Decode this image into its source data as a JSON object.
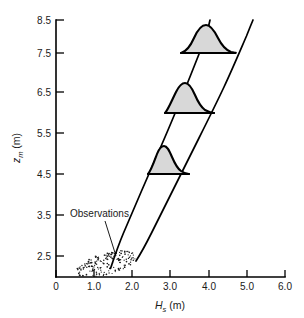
{
  "chart_data": {
    "type": "line",
    "title": "",
    "subtitle": "",
    "xlabel": "Hs (m)",
    "xlabel_symbol": "H",
    "xlabel_sub": "s",
    "xlabel_unit": "(m)",
    "ylabel": "zm (m)",
    "ylabel_symbol": "z",
    "ylabel_sub": "m",
    "ylabel_unit": "(m)",
    "xlim": [
      0,
      6.0
    ],
    "ylim": [
      2.0,
      8.5
    ],
    "grid": false,
    "legend": "none",
    "xticks": [
      0,
      1.0,
      2.0,
      3.0,
      4.0,
      5.0,
      6.0
    ],
    "xticklabels": [
      "0",
      "1.0",
      "2.0",
      "3.0",
      "4.0",
      "5.0",
      "6.0"
    ],
    "yticks": [
      2.5,
      3.5,
      4.5,
      5.5,
      6.5,
      7.5,
      8.5
    ],
    "yticklabels": [
      "2.5",
      "3.5",
      "4.5",
      "5.5",
      "6.5",
      "7.5",
      "8.5"
    ],
    "series": [
      {
        "name": "upper-envelope-curve",
        "description": "left steeper boundary curve",
        "x": [
          1.42,
          1.58,
          1.8,
          2.05,
          2.32,
          2.6,
          2.88,
          3.16,
          3.44,
          3.7,
          3.95
        ],
        "y": [
          2.22,
          2.7,
          3.3,
          3.95,
          4.6,
          5.25,
          5.9,
          6.55,
          7.2,
          7.85,
          8.5
        ]
      },
      {
        "name": "lower-envelope-curve",
        "description": "right shallower boundary curve",
        "x": [
          2.1,
          2.28,
          2.55,
          2.88,
          3.25,
          3.62,
          3.98,
          4.32,
          4.64,
          4.92,
          5.15
        ],
        "y": [
          2.4,
          2.7,
          3.15,
          3.72,
          4.35,
          5.0,
          5.66,
          6.32,
          6.98,
          7.7,
          8.5
        ]
      }
    ],
    "distributions": [
      {
        "name": "pdf-upper",
        "baseline_z": 7.5,
        "x_start": 3.28,
        "x_end": 4.63,
        "peak_x": 4.0,
        "peak_height_z": 1.05,
        "skew": "right"
      },
      {
        "name": "pdf-middle",
        "baseline_z": 6.0,
        "x_start": 2.86,
        "x_end": 4.16,
        "peak_x": 3.33,
        "peak_height_z": 0.95,
        "skew": "right"
      },
      {
        "name": "pdf-lower",
        "baseline_z": 4.5,
        "x_start": 2.42,
        "x_end": 3.58,
        "peak_x": 2.78,
        "peak_height_z": 0.85,
        "skew": "right"
      }
    ],
    "scatter_cloud": {
      "name": "observations",
      "x_range": [
        0.5,
        2.12
      ],
      "z_range": [
        1.98,
        2.72
      ],
      "center_x": 1.3,
      "center_z": 2.32,
      "point_count": 170,
      "marker": "dot"
    },
    "annotations": [
      {
        "name": "observations-annotation",
        "text": "Observations",
        "text_x": 0.62,
        "text_z": 3.55,
        "target_x": 1.48,
        "target_z": 2.3
      }
    ],
    "colors": {
      "axis": "#000000",
      "curve": "#000000",
      "pdf_fill": "#d8d8d8",
      "pdf_outline": "#000000",
      "dots": "#1a1a1a",
      "background": "#ffffff"
    }
  },
  "annotation": {
    "observations_label": "Observations"
  },
  "axes": {
    "x_title_symbol": "H",
    "x_title_sub": "s",
    "x_title_unit": " (m)",
    "y_title_symbol": "z",
    "y_title_sub": "m",
    "y_title_unit": " (m)"
  }
}
